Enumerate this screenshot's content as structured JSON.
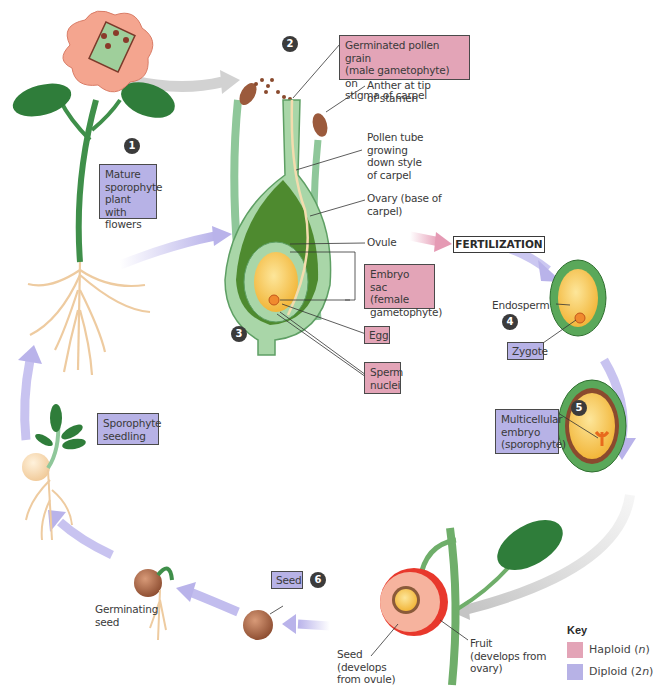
{
  "diagram": {
    "fertilization_label": "FERTILIZATION",
    "steps": [
      {
        "number": "1",
        "label": "Mature sporophyte plant with flowers",
        "type": "diploid"
      },
      {
        "number": "2",
        "label": "Germinated pollen grain (male gametophyte) on stigma of carpel",
        "type": "haploid"
      },
      {
        "number": "3",
        "label": "",
        "type": ""
      },
      {
        "number": "4",
        "label": "Zygote",
        "type": "diploid"
      },
      {
        "number": "5",
        "label": "Multicellular embryo (sporophyte)",
        "type": "diploid"
      },
      {
        "number": "6",
        "label": "Seed",
        "type": "diploid"
      }
    ],
    "boxes": {
      "mature_sporophyte": [
        "Mature",
        "sporophyte",
        "plant with",
        "flowers"
      ],
      "pollen_grain": [
        "Germinated pollen grain",
        "(male gametophyte) on",
        "stigma of carpel"
      ],
      "embryo_sac": [
        "Embryo sac",
        "(female",
        "gametophyte)"
      ],
      "egg": "Egg",
      "sperm_nuclei": [
        "Sperm",
        "nuclei"
      ],
      "zygote": "Zygote",
      "multicellular_embryo": [
        "Multicellular",
        "embryo",
        "(sporophyte)"
      ],
      "seed": "Seed",
      "sporophyte_seedling": [
        "Sporophyte",
        "seedling"
      ]
    },
    "labels": {
      "anther": [
        "Anther at tip",
        "of stamen"
      ],
      "pollen_tube": [
        "Pollen tube",
        "growing",
        "down style",
        "of carpel"
      ],
      "ovary": [
        "Ovary (base of",
        "carpel)"
      ],
      "ovule": "Ovule",
      "endosperm": "Endosperm",
      "germinating_seed": [
        "Germinating",
        "seed"
      ],
      "seed_from_ovule": [
        "Seed",
        "(develops",
        "from ovule)"
      ],
      "fruit": [
        "Fruit",
        "(develops from",
        "ovary)"
      ]
    },
    "key": {
      "title": "Key",
      "items": [
        {
          "label_prefix": "Haploid (",
          "label_var": "n",
          "label_suffix": ")",
          "color": "#e3a4b7"
        },
        {
          "label_prefix": "Diploid (2",
          "label_var": "n",
          "label_suffix": ")",
          "color": "#b7b2e6"
        }
      ]
    },
    "colors": {
      "haploid": "#e3a4b7",
      "diploid": "#b7b2e6",
      "cycle_arrow": "#b9b3ea",
      "fertilization_arrow": "#e59ab4",
      "stem_green": "#3f8f4a",
      "leaf_green": "#2f7d3a",
      "petal": "#f4a58f",
      "root": "#f3d2a8",
      "seed_brown": "#9b5a3c",
      "endosperm": "#f4c24a"
    }
  }
}
